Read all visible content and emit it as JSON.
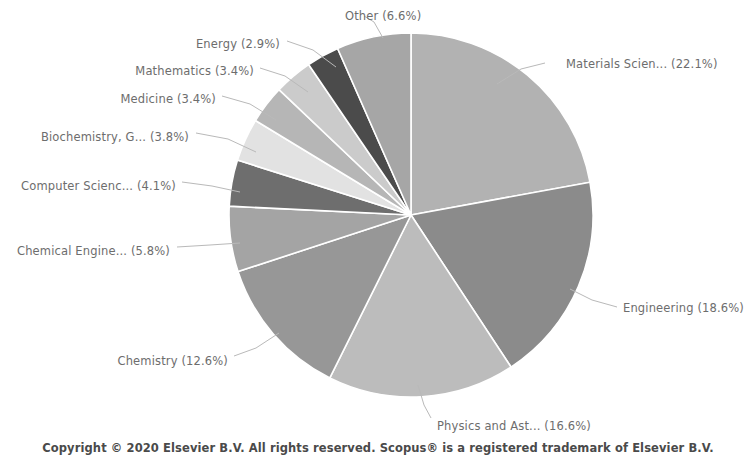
{
  "chart_data": {
    "type": "pie",
    "title": "",
    "subtitle": "",
    "legend_position": "callout-labels",
    "grid": false,
    "start_angle_deg": 0,
    "direction": "clockwise",
    "units": "percent",
    "categories": [
      "Materials Scien...",
      "Engineering",
      "Physics and Ast...",
      "Chemistry",
      "Chemical Engine...",
      "Computer Scienc...",
      "Biochemistry, G...",
      "Medicine",
      "Mathematics",
      "Energy",
      "Other"
    ],
    "values": [
      22.1,
      18.6,
      16.6,
      12.6,
      5.8,
      4.1,
      3.8,
      3.4,
      3.4,
      2.9,
      6.6
    ],
    "colors": [
      "#b2b2b2",
      "#8b8b8b",
      "#bcbcbc",
      "#979797",
      "#a4a4a4",
      "#6e6e6e",
      "#e2e2e2",
      "#b6b6b6",
      "#cbcbcb",
      "#4b4b4b",
      "#a6a6a6"
    ],
    "slices": [
      {
        "label": "Materials Scien... (22.1%)",
        "name": "Materials Scien...",
        "value": 22.1,
        "color": "#b2b2b2",
        "label_x": 566,
        "label_y": 58,
        "label_align": "start",
        "leader": [
          [
            545,
            63
          ],
          [
            521,
            69
          ],
          [
            497,
            84
          ]
        ]
      },
      {
        "label": "Engineering (18.6%)",
        "name": "Engineering",
        "value": 18.6,
        "color": "#8b8b8b",
        "label_x": 623,
        "label_y": 302,
        "label_align": "start",
        "leader": [
          [
            617,
            307
          ],
          [
            592,
            300
          ],
          [
            570,
            289
          ]
        ]
      },
      {
        "label": "Physics and Ast... (16.6%)",
        "name": "Physics and Ast...",
        "value": 16.6,
        "color": "#bcbcbc",
        "label_x": 437,
        "label_y": 420,
        "label_align": "start",
        "leader": [
          [
            431,
            418
          ],
          [
            424,
            405
          ],
          [
            418,
            385
          ]
        ]
      },
      {
        "label": "Chemistry (12.6%)",
        "name": "Chemistry",
        "value": 12.6,
        "color": "#979797",
        "label_x": 228,
        "label_y": 355,
        "label_align": "end",
        "leader": [
          [
            234,
            356
          ],
          [
            256,
            348
          ],
          [
            279,
            333
          ]
        ]
      },
      {
        "label": "Chemical Engine... (5.8%)",
        "name": "Chemical Engine...",
        "value": 5.8,
        "color": "#a4a4a4",
        "label_x": 170,
        "label_y": 245,
        "label_align": "end",
        "leader": [
          [
            177,
            247
          ],
          [
            210,
            245
          ],
          [
            240,
            243
          ]
        ]
      },
      {
        "label": "Computer Scienc... (4.1%)",
        "name": "Computer Scienc...",
        "value": 4.1,
        "color": "#6e6e6e",
        "label_x": 176,
        "label_y": 180,
        "label_align": "end",
        "leader": [
          [
            182,
            182
          ],
          [
            212,
            186
          ],
          [
            240,
            192
          ]
        ]
      },
      {
        "label": "Biochemistry, G... (3.8%)",
        "name": "Biochemistry, G...",
        "value": 3.8,
        "color": "#e2e2e2",
        "label_x": 189,
        "label_y": 131,
        "label_align": "end",
        "leader": [
          [
            196,
            133
          ],
          [
            228,
            139
          ],
          [
            256,
            152
          ]
        ]
      },
      {
        "label": "Medicine (3.4%)",
        "name": "Medicine",
        "value": 3.4,
        "color": "#b6b6b6",
        "label_x": 216,
        "label_y": 93,
        "label_align": "end",
        "leader": [
          [
            222,
            96
          ],
          [
            250,
            104
          ],
          [
            276,
            120
          ]
        ]
      },
      {
        "label": "Mathematics (3.4%)",
        "name": "Mathematics",
        "value": 3.4,
        "color": "#cbcbcb",
        "label_x": 254,
        "label_y": 65,
        "label_align": "end",
        "leader": [
          [
            260,
            68
          ],
          [
            285,
            76
          ],
          [
            308,
            92
          ]
        ]
      },
      {
        "label": "Energy (2.9%)",
        "name": "Energy",
        "value": 2.9,
        "color": "#4b4b4b",
        "label_x": 280,
        "label_y": 38,
        "label_align": "end",
        "leader": [
          [
            287,
            41
          ],
          [
            313,
            50
          ],
          [
            336,
            67
          ]
        ]
      },
      {
        "label": "Other (6.6%)",
        "name": "Other",
        "value": 6.6,
        "color": "#a6a6a6",
        "label_x": 345,
        "label_y": 10,
        "label_align": "start",
        "leader": [
          [
            364,
            16
          ],
          [
            374,
            22
          ],
          [
            383,
            38
          ]
        ]
      }
    ],
    "geometry": {
      "center_x": 411,
      "center_y": 215,
      "radius": 182,
      "separator_color": "#ffffff",
      "separator_width": 1.6
    }
  },
  "footer": {
    "copyright": "Copyright © 2020 Elsevier B.V. All rights reserved. Scopus® is a registered trademark of Elsevier B.V."
  },
  "style": {
    "background": "#ffffff",
    "label_color": "#6d6d6d",
    "leader_color": "#b9b9b9",
    "footer_color": "#4a4a4a"
  }
}
